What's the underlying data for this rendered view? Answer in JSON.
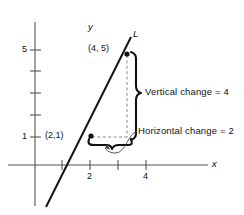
{
  "figure": {
    "line_label": "L",
    "axes": {
      "x_label": "x",
      "y_label": "y",
      "x_ticks": [
        {
          "value": 1,
          "label": ""
        },
        {
          "value": 2,
          "label": "2"
        },
        {
          "value": 3,
          "label": ""
        },
        {
          "value": 4,
          "label": "4"
        }
      ],
      "y_ticks": [
        {
          "value": 1,
          "label": "1"
        },
        {
          "value": 2,
          "label": ""
        },
        {
          "value": 3,
          "label": ""
        },
        {
          "value": 4,
          "label": ""
        },
        {
          "value": 5,
          "label": "5"
        }
      ],
      "x_range": [
        -0.6,
        6.2
      ],
      "y_range": [
        -1.6,
        6.3
      ]
    },
    "points": [
      {
        "label": "(4, 5)",
        "x": 4,
        "y": 5
      },
      {
        "label": "(2,1)",
        "x": 2,
        "y": 1
      }
    ],
    "annotations": [
      {
        "name": "vertical-change",
        "text": "Vertical change = 4",
        "value": 4
      },
      {
        "name": "horizontal-change",
        "text": "Horizontal change = 2",
        "value": 2
      }
    ],
    "colors": {
      "ink": "#111111",
      "axis": "#444444",
      "guide": "#888888",
      "background": "#ffffff"
    }
  }
}
